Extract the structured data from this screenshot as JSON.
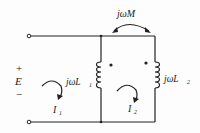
{
  "diagram": {
    "type": "coupled-inductor-circuit",
    "source": {
      "label": "E",
      "plus": "+",
      "minus": "−"
    },
    "mutual": {
      "label": "jωM"
    },
    "inductor_left": {
      "label_main": "jωL",
      "subscript": "1"
    },
    "inductor_right": {
      "label_main": "jωL",
      "subscript": "2"
    },
    "current_left": {
      "label_main": "I",
      "subscript": "1"
    },
    "current_right": {
      "label_main": "I",
      "subscript": "2"
    },
    "colors": {
      "wire": "#222222",
      "background": "#fdfdfd"
    }
  }
}
